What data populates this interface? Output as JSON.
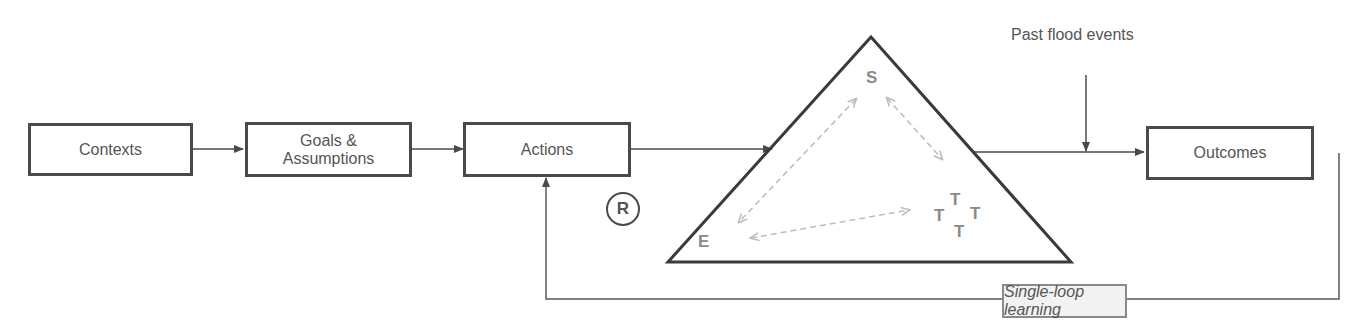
{
  "diagram": {
    "boxes": {
      "contexts": "Contexts",
      "goals_line1": "Goals &",
      "goals_line2": "Assumptions",
      "actions": "Actions",
      "outcomes": "Outcomes"
    },
    "external_input": "Past flood events",
    "triangle": {
      "top": "S",
      "bottom_left": "E",
      "cluster": [
        "T",
        "T",
        "T",
        "T"
      ]
    },
    "loop_symbol": "R",
    "feedback_label": "Single-loop learning",
    "colors": {
      "box_border": "#4a4a4a",
      "text": "#555555",
      "triangle_labels": "#8a8a8a",
      "dashed_arrows": "#bdbdbd",
      "loop_label_bg": "#f2f2f2"
    }
  }
}
